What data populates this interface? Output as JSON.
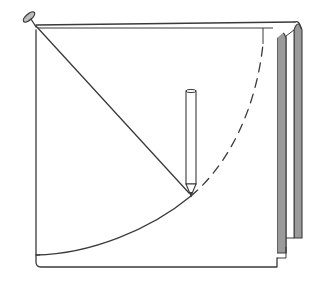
{
  "figure": {
    "title": "Drawing a quarter-circle arc with a pin, string and pencil on folded paper",
    "elements": {
      "pin": "pin-icon",
      "string": "string",
      "pencil": "pencil-icon",
      "arc_drawn": "solid arc",
      "arc_remaining": "dashed arc",
      "paper": "folded paper stack"
    },
    "colors": {
      "ink": "#3a3a3a",
      "shade": "#9a9a9a",
      "paper": "#ffffff"
    }
  }
}
